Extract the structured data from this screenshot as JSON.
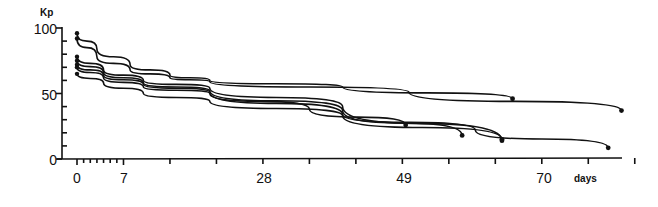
{
  "chart_data": {
    "type": "line",
    "title": "",
    "xlabel": "days",
    "ylabel": "Kp",
    "xlim": [
      -2,
      84
    ],
    "ylim": [
      0,
      100
    ],
    "x_ticks": [
      0,
      7,
      28,
      49,
      70
    ],
    "y_ticks": [
      0,
      50,
      100
    ],
    "grid": false,
    "legend": null,
    "series": [
      {
        "name": "curve-1",
        "points": [
          [
            0,
            96
          ],
          [
            3,
            84
          ],
          [
            8,
            72
          ],
          [
            14,
            64
          ],
          [
            20,
            60
          ],
          [
            40,
            55
          ],
          [
            65.6,
            46
          ]
        ]
      },
      {
        "name": "curve-2",
        "points": [
          [
            0,
            92
          ],
          [
            3,
            78
          ],
          [
            8,
            68
          ],
          [
            14,
            62
          ],
          [
            20,
            59
          ],
          [
            50,
            51
          ],
          [
            82,
            37
          ]
        ]
      },
      {
        "name": "curve-3",
        "points": [
          [
            0,
            78
          ],
          [
            4,
            68
          ],
          [
            10,
            60
          ],
          [
            20,
            54
          ],
          [
            40,
            40
          ],
          [
            64,
            14
          ]
        ]
      },
      {
        "name": "curve-4",
        "points": [
          [
            0,
            75
          ],
          [
            4,
            66
          ],
          [
            10,
            58
          ],
          [
            20,
            52
          ],
          [
            40,
            37
          ],
          [
            58,
            18
          ]
        ]
      },
      {
        "name": "curve-5",
        "points": [
          [
            0,
            72
          ],
          [
            4,
            64
          ],
          [
            10,
            57
          ],
          [
            20,
            51
          ],
          [
            40,
            34
          ],
          [
            60,
            22
          ],
          [
            80,
            8.5
          ]
        ]
      },
      {
        "name": "curve-6",
        "points": [
          [
            0,
            70
          ],
          [
            4,
            62
          ],
          [
            10,
            55
          ],
          [
            20,
            50
          ],
          [
            35,
            38
          ],
          [
            49.5,
            26
          ]
        ]
      },
      {
        "name": "curve-7",
        "points": [
          [
            0,
            65
          ],
          [
            4,
            58
          ],
          [
            10,
            50
          ],
          [
            20,
            44
          ],
          [
            40,
            33
          ],
          [
            64,
            15
          ]
        ]
      }
    ]
  },
  "labels": {
    "y_unit": "Kp",
    "x_unit": "days",
    "y_tick_labels": [
      "100",
      "50",
      "0"
    ],
    "x_tick_labels": [
      "0",
      "7",
      "28",
      "49",
      "70"
    ]
  }
}
